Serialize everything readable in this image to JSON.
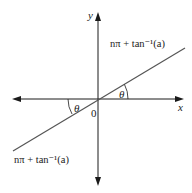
{
  "diagram": {
    "type": "coordinate-axes-with-line",
    "axes": {
      "x_label": "x",
      "y_label": "y",
      "origin_label": "0"
    },
    "line": {
      "upper_label": "nπ + tan⁻¹(a)",
      "lower_label": "nπ + tan⁻¹(a)"
    },
    "angles": {
      "right_angle_label": "θ",
      "left_angle_label": "θ"
    },
    "colors": {
      "axis": "#1a1a1a",
      "line": "#555555",
      "background": "#ffffff"
    }
  }
}
